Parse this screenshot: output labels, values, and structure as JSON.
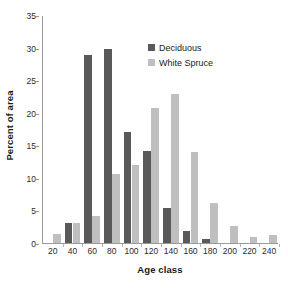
{
  "chart_data": {
    "type": "bar",
    "title": "",
    "xlabel": "Age class",
    "ylabel": "Percent of area",
    "categories": [
      "20",
      "40",
      "60",
      "80",
      "100",
      "120",
      "140",
      "160",
      "180",
      "200",
      "220",
      "240"
    ],
    "series": [
      {
        "name": "Deciduous",
        "color": "#595959",
        "values": [
          0,
          3.0,
          28.8,
          29.8,
          17.0,
          14.1,
          5.4,
          1.8,
          0.6,
          0,
          0,
          0
        ]
      },
      {
        "name": "White Spruce",
        "color": "#bfbfbf",
        "values": [
          1.4,
          3.0,
          4.2,
          10.6,
          12.0,
          20.8,
          22.9,
          14.0,
          6.1,
          2.6,
          0.9,
          1.3
        ]
      }
    ],
    "ylim": [
      0,
      35
    ],
    "ytick_step": 5,
    "yticks": [
      "0",
      "5",
      "10",
      "15",
      "20",
      "25",
      "30",
      "35"
    ],
    "grid": false,
    "legend_position": "top-right"
  },
  "legend": {
    "items": [
      {
        "label": "Deciduous",
        "color": "#595959"
      },
      {
        "label": "White Spruce",
        "color": "#bfbfbf"
      }
    ]
  },
  "axes": {
    "y_title": "Percent of area",
    "x_title": "Age class"
  }
}
